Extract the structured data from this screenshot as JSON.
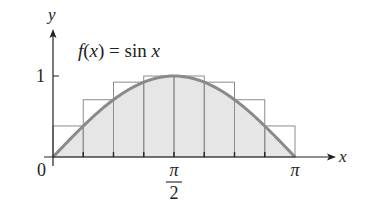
{
  "chart_data": {
    "type": "area",
    "title": "f(x) = sin x",
    "function": "sin x",
    "xlabel": "x",
    "ylabel": "y",
    "x_ticks": [
      "0",
      "π/2",
      "π"
    ],
    "y_ticks": [
      "1"
    ],
    "xlim": [
      0,
      3.1416
    ],
    "ylim": [
      0,
      1
    ],
    "grid": false,
    "legend": "none",
    "partitions": 8,
    "rectangles": {
      "kind": "upper sum",
      "x_left": [
        0,
        0.3927,
        0.7854,
        1.1781,
        1.5708,
        1.9635,
        2.3562,
        2.7489
      ],
      "width": 0.3927,
      "heights": [
        0.383,
        0.707,
        0.924,
        1.0,
        1.0,
        0.924,
        0.707,
        0.383
      ]
    },
    "curve_samples": {
      "x": [
        0,
        0.3927,
        0.7854,
        1.1781,
        1.5708,
        1.9635,
        2.3562,
        2.7489,
        3.1416
      ],
      "y": [
        0,
        0.383,
        0.707,
        0.924,
        1.0,
        0.924,
        0.707,
        0.383,
        0
      ]
    }
  },
  "labels": {
    "title": "f(x) = sin x",
    "x_axis": "x",
    "y_axis": "y",
    "origin": "0",
    "y_one": "1",
    "pi_half_num": "π",
    "pi_half_den": "2",
    "pi": "π"
  },
  "colors": {
    "curve": "#8a8a8a",
    "fill": "#e6e6e6",
    "rect_stroke": "#8c8c8c",
    "axis": "#222222",
    "text": "#222222"
  }
}
